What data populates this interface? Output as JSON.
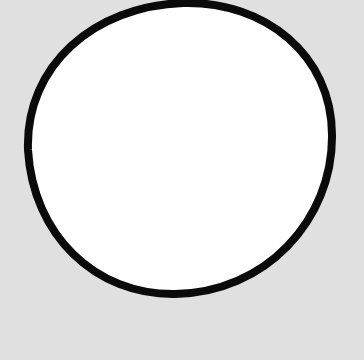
{
  "canvas": {
    "width": 364,
    "height": 360,
    "background_color": "#e0e0e0"
  },
  "shape": {
    "type": "circle",
    "description": "hand-drawn circle",
    "cx": 180,
    "cy": 147,
    "rx": 152,
    "ry": 146,
    "fill_color": "#ffffff",
    "stroke_color": "#0a0a0a",
    "stroke_width": 8
  }
}
